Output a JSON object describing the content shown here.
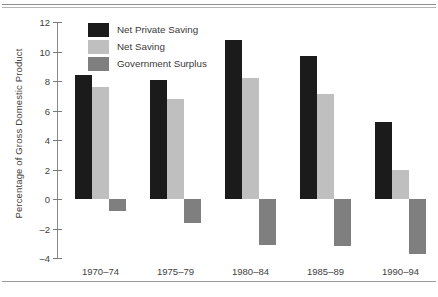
{
  "chart_data": {
    "type": "bar",
    "title": "",
    "subtitle": "",
    "xlabel": "",
    "ylabel": "Percentage of Gross Domestic Product",
    "categories": [
      "1970–74",
      "1975–79",
      "1980–84",
      "1985–89",
      "1990–94"
    ],
    "series": [
      {
        "name": "Net Private Saving",
        "color": "#1b1b1b",
        "values": [
          8.4,
          8.1,
          10.8,
          9.7,
          5.2
        ]
      },
      {
        "name": "Net Saving",
        "color": "#bfbfbf",
        "values": [
          7.6,
          6.8,
          8.2,
          7.1,
          2.0
        ]
      },
      {
        "name": "Government Surplus",
        "color": "#7f7f7f",
        "values": [
          -0.8,
          -1.6,
          -3.1,
          -3.2,
          -3.7
        ]
      }
    ],
    "ylim": [
      -4,
      12
    ],
    "yticks": [
      12,
      10,
      8,
      6,
      4,
      2,
      0,
      -2,
      -4
    ],
    "ytick_labels": [
      "12",
      "10",
      "8",
      "6",
      "4",
      "2",
      "0",
      "–2",
      "–4"
    ],
    "grid": false,
    "legend_position": "top-left"
  },
  "legend": {
    "entries": [
      {
        "label": "Net Private Saving"
      },
      {
        "label": "Net Saving"
      },
      {
        "label": "Government Surplus"
      }
    ]
  },
  "footer": {
    "note": ""
  }
}
